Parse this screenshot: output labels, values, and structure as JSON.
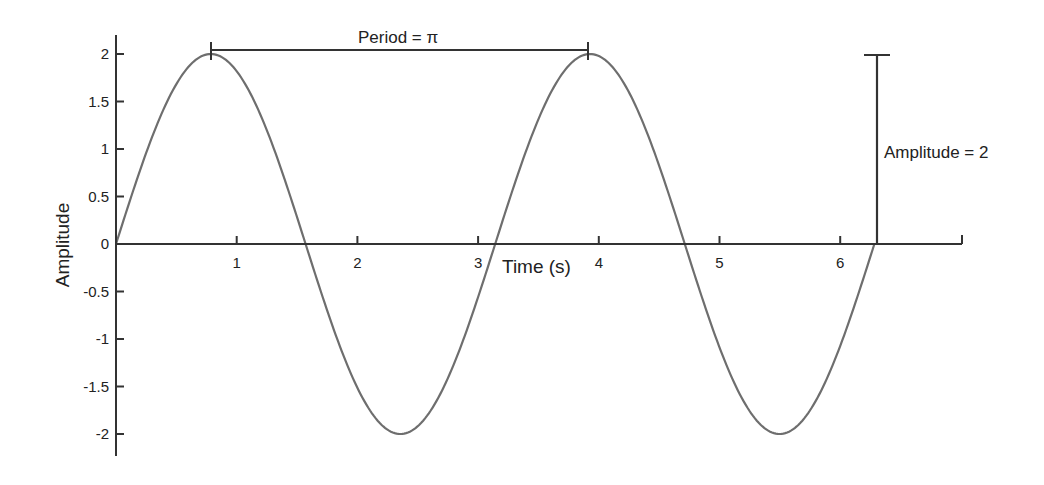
{
  "chart_data": {
    "type": "line",
    "title": "",
    "xlabel": "Time (s)",
    "ylabel": "Amplitude",
    "function": "y = 2*sin(2t)",
    "x_range": [
      0,
      6.2832
    ],
    "xlim": [
      0,
      7
    ],
    "ylim": [
      -2.2,
      2.2
    ],
    "grid": false,
    "legend": null,
    "x_ticks": [
      1,
      2,
      3,
      4,
      5,
      6
    ],
    "x_tick_labels": [
      "1",
      "2",
      "3",
      "4",
      "5",
      "6"
    ],
    "y_ticks": [
      2,
      1.5,
      1,
      0.5,
      0,
      -0.5,
      -1,
      -1.5,
      -2
    ],
    "y_tick_labels": [
      "2",
      "1.5",
      "1",
      "0.5",
      "0",
      "-0.5",
      "-1",
      "-1.5",
      "-2"
    ],
    "series": [
      {
        "name": "2 sin(2t)",
        "color": "#6e6e6e",
        "x": [
          0,
          0.3927,
          0.7854,
          1.1781,
          1.5708,
          1.9635,
          2.3562,
          2.7489,
          3.1416,
          3.5343,
          3.927,
          4.3197,
          4.7124,
          5.1051,
          5.4978,
          5.8905,
          6.2832
        ],
        "values": [
          0,
          1.414,
          2,
          1.414,
          0,
          -1.414,
          -2,
          -1.414,
          0,
          1.414,
          2,
          1.414,
          0,
          -1.414,
          -2,
          -1.414,
          0
        ]
      }
    ],
    "annotations": [
      {
        "text": "Period = π",
        "type": "horizontal-bracket",
        "x_start": 0.7854,
        "x_end": 3.927,
        "y": 2.1
      },
      {
        "text": "Amplitude = 2",
        "type": "vertical-bracket",
        "x": 6.2832,
        "y_start": 0,
        "y_end": 2
      }
    ]
  },
  "labels": {
    "xlabel": "Time (s)",
    "ylabel": "Amplitude",
    "period": "Period = π",
    "amplitude": "Amplitude = 2",
    "x_ticks": [
      "1",
      "2",
      "3",
      "4",
      "5",
      "6"
    ],
    "y_ticks": [
      "2",
      "1.5",
      "1",
      "0.5",
      "0",
      "-0.5",
      "-1",
      "-1.5",
      "-2"
    ]
  },
  "colors": {
    "axis": "#333333",
    "curve": "#6e6e6e",
    "text": "#222222"
  }
}
